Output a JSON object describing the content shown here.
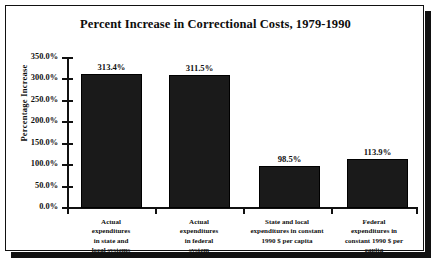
{
  "chart_data": {
    "type": "bar",
    "title": "Percent Increase in Correctional Costs, 1979-1990",
    "xlabel": "",
    "ylabel": "Percentage Increase",
    "ylim": [
      0,
      350
    ],
    "ytick_step": 50,
    "grid": false,
    "legend": "none",
    "categories": [
      "Actual expenditures in state and local systems",
      "Actual expenditures in federal system",
      "State and local expenditures in constant 1990 $ per capita",
      "Federal expenditures in constant 1990 $ per capita"
    ],
    "category_lines": [
      [
        "Actual",
        "expenditures",
        "in state and",
        "local systems"
      ],
      [
        "Actual",
        "expenditures",
        "in federal",
        "system"
      ],
      [
        "State and local",
        "expenditures in constant",
        "1990 $ per capita"
      ],
      [
        "Federal",
        "expenditures in",
        "constant 1990 $ per",
        "capita"
      ]
    ],
    "values": [
      313.4,
      311.5,
      98.5,
      113.9
    ],
    "value_labels": [
      "313.4%",
      "311.5%",
      "98.5%",
      "113.9%"
    ],
    "ytick_labels": [
      "350.0%",
      "300.0%",
      "250.0%",
      "200.0%",
      "150.0%",
      "100.0%",
      "50.0%",
      "0.0%"
    ],
    "ytick_values": [
      350,
      300,
      250,
      200,
      150,
      100,
      50,
      0
    ],
    "bar_color": "#1a1a1a",
    "axis_color": "#111111",
    "background": "#ffffff"
  }
}
